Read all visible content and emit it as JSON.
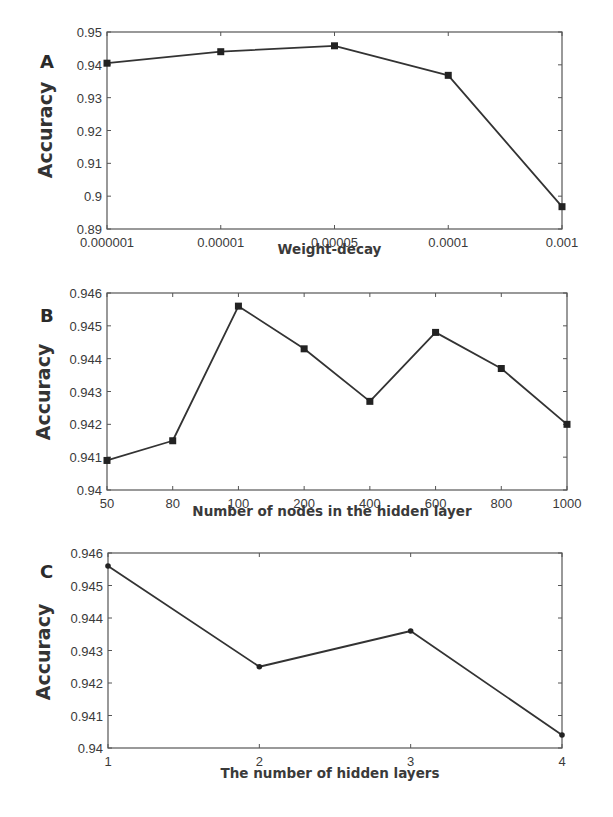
{
  "figure": {
    "panels": [
      {
        "letter": "A",
        "ylabel": "Accuracy",
        "xlabel": "Weight-decay"
      },
      {
        "letter": "B",
        "ylabel": "Accuracy",
        "xlabel": "Number of nodes in the hidden layer"
      },
      {
        "letter": "C",
        "ylabel": "Accuracy",
        "xlabel": "The number of hidden layers"
      }
    ]
  },
  "chart_data": [
    {
      "type": "line",
      "panel": "A",
      "title": "",
      "xlabel": "Weight-decay",
      "ylabel": "Accuracy",
      "categories": [
        "0.000001",
        "0.00001",
        "0.00005",
        "0.0001",
        "0.001"
      ],
      "values": [
        0.9405,
        0.944,
        0.9458,
        0.9368,
        0.8968
      ],
      "ylim": [
        0.89,
        0.95
      ],
      "yticks": [
        "0.89",
        "0.9",
        "0.91",
        "0.92",
        "0.93",
        "0.94",
        "0.95"
      ],
      "marker": "square",
      "grid": false,
      "legend": null
    },
    {
      "type": "line",
      "panel": "B",
      "title": "",
      "xlabel": "Number of nodes in the hidden layer",
      "ylabel": "Accuracy",
      "categories": [
        "50",
        "80",
        "100",
        "200",
        "400",
        "600",
        "800",
        "1000"
      ],
      "values": [
        0.9409,
        0.9415,
        0.9456,
        0.9443,
        0.9427,
        0.9448,
        0.9437,
        0.942
      ],
      "ylim": [
        0.94,
        0.946
      ],
      "yticks": [
        "0.94",
        "0.941",
        "0.942",
        "0.943",
        "0.944",
        "0.945",
        "0.946"
      ],
      "marker": "square",
      "grid": false,
      "legend": null
    },
    {
      "type": "line",
      "panel": "C",
      "title": "",
      "xlabel": "The number of hidden layers",
      "ylabel": "Accuracy",
      "categories": [
        "1",
        "2",
        "3",
        "4"
      ],
      "values": [
        0.9456,
        0.9425,
        0.9436,
        0.9404
      ],
      "ylim": [
        0.94,
        0.946
      ],
      "yticks": [
        "0.94",
        "0.941",
        "0.942",
        "0.943",
        "0.944",
        "0.945",
        "0.946"
      ],
      "marker": "dot",
      "grid": false,
      "legend": null
    }
  ]
}
